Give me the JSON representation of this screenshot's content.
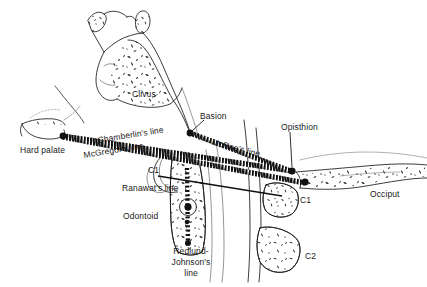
{
  "figure": {
    "type": "anatomical-line-diagram",
    "background_color": "#ffffff",
    "ink_color": "#1a1a1a",
    "width": 427,
    "height": 287
  },
  "labels": {
    "clivus": "Clivus",
    "basion": "Basion",
    "opisthion": "Opisthion",
    "hard_palate": "Hard palate",
    "chamberlin_line": "Chamberlin's line",
    "mcgregor_line": "McGregor's line",
    "mcrae_line": "McRae's line",
    "ranawat_line": "Ranawat's line",
    "odontoid": "Odontoid",
    "redlund_johnson_line_1": "Redlund-",
    "redlund_johnson_line_2": "Johnson's",
    "redlund_johnson_line_3": "line",
    "c1_left": "C1",
    "c1_right": "C1",
    "c2": "C2",
    "occiput": "Occiput"
  },
  "landmarks": [
    {
      "name": "hard-palate-point",
      "x": 63,
      "y": 136
    },
    {
      "name": "basion-point",
      "x": 190,
      "y": 133
    },
    {
      "name": "opisthion-point",
      "x": 292,
      "y": 171
    },
    {
      "name": "mcgregor-occipital-point",
      "x": 305,
      "y": 182
    },
    {
      "name": "odontoid-tip-point",
      "x": 188,
      "y": 200
    },
    {
      "name": "odontoid-base-point",
      "x": 188,
      "y": 243
    },
    {
      "name": "odontoid-mid-point",
      "x": 187,
      "y": 220
    }
  ],
  "reference_lines": [
    {
      "name": "chamberlin-line",
      "style": "dotted-hatched",
      "from": "hard-palate",
      "to": "opisthion"
    },
    {
      "name": "mcgregor-line",
      "style": "dotted-hatched",
      "from": "hard-palate",
      "to": "occipital-curve"
    },
    {
      "name": "mcrae-line",
      "style": "dotted-hatched",
      "from": "basion",
      "to": "opisthion"
    },
    {
      "name": "ranawat-line",
      "style": "solid",
      "from": "c1-left",
      "to": "c1-right-lateral-mass"
    },
    {
      "name": "redlund-johnson-line",
      "style": "dotted",
      "from": "odontoid-tip",
      "to": "odontoid-base"
    }
  ]
}
